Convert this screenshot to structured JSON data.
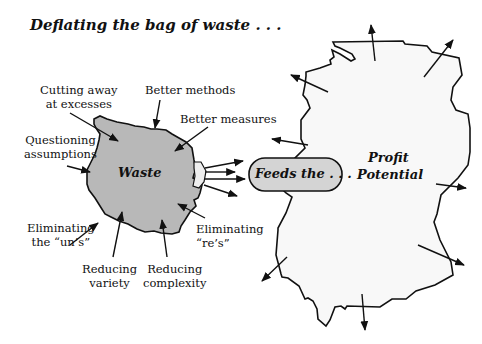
{
  "title": "Deflating the bag of waste . . .",
  "waste_blob": {
    "label": "Waste",
    "fill": "#b8b8b8"
  },
  "connector": {
    "label": "Feeds the . . .",
    "fill": "#d4d4d4"
  },
  "profit_blob": {
    "label_line1": "Profit",
    "label_line2": "Potential",
    "fill": "#f8f8f8"
  },
  "labels": {
    "cutting_1": "Cutting away",
    "cutting_2": "at excesses",
    "methods": "Better methods",
    "measures": "Better measures",
    "questioning_1": "Questioning",
    "questioning_2": "assumptions",
    "uns_1": "Eliminating",
    "uns_2": "the “un’s”",
    "variety_1": "Reducing",
    "variety_2": "variety",
    "complexity_1": "Reducing",
    "complexity_2": "complexity",
    "res_1": "Eliminating",
    "res_2": "“re’s”"
  }
}
